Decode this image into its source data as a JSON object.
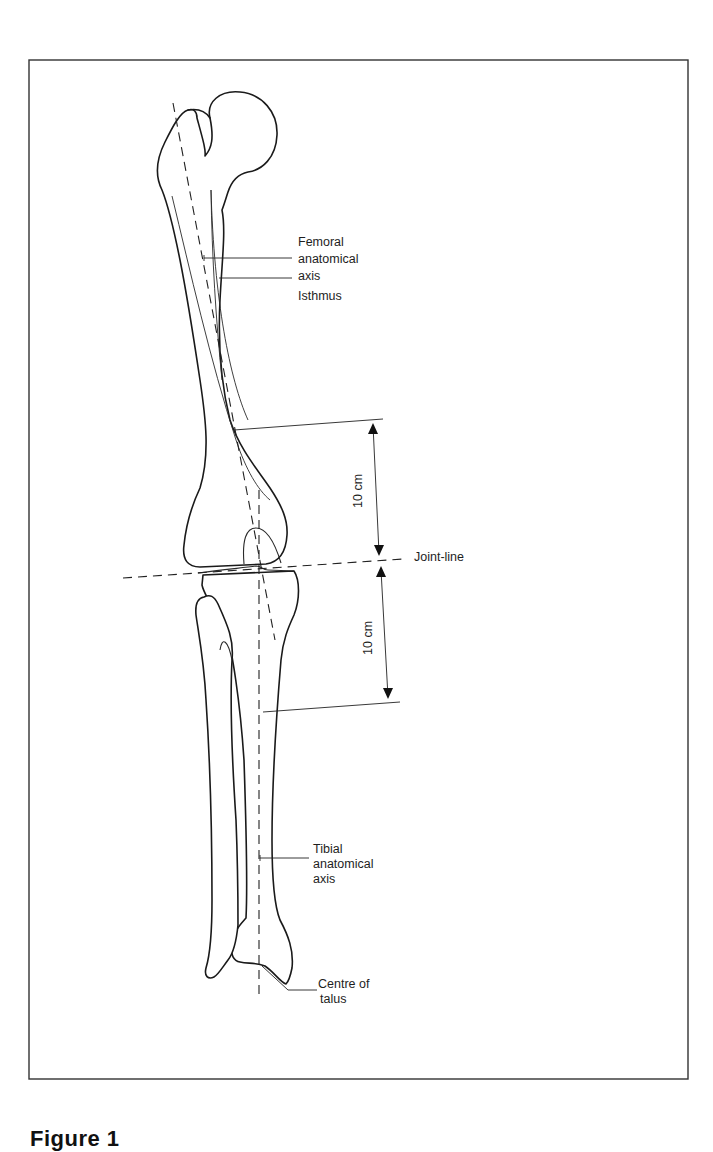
{
  "figure": {
    "caption": "Figure 1",
    "labels": {
      "femoral_axis": [
        "Femoral",
        "anatomical",
        "axis"
      ],
      "isthmus": "Isthmus",
      "joint_line": "Joint-line",
      "upper_distance": "10 cm",
      "lower_distance": "10 cm",
      "tibial_axis": [
        "Tibial",
        "anatomical",
        "axis"
      ],
      "talus": [
        "Centre of",
        "talus"
      ]
    },
    "colors": {
      "line": "#1a1a1a",
      "background": "#ffffff",
      "frame": "#333333"
    }
  }
}
